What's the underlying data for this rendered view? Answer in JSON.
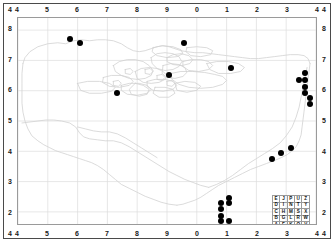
{
  "figure": {
    "kind": "distribution-map",
    "background": "#ffffff",
    "frame_color": "#4a4a4a",
    "plot_border_color": "#9a9a9a",
    "grid_color": "#dcdcdc",
    "coastline_color": "#d2d2d2",
    "marker_color": "#000000",
    "label_color": "#1a1a1a"
  },
  "axes": {
    "top_labels": [
      "4",
      "5",
      "6",
      "7",
      "8",
      "9",
      "0",
      "1",
      "2",
      "3",
      "4"
    ],
    "bottom_labels": [
      "4",
      "5",
      "6",
      "7",
      "8",
      "9",
      "0",
      "1",
      "2",
      "3",
      "4"
    ],
    "left_labels": [
      "4",
      "8",
      "7",
      "6",
      "5",
      "4",
      "3",
      "2",
      "4"
    ],
    "right_labels": [
      "4",
      "8",
      "7",
      "6",
      "5",
      "4",
      "3",
      "2",
      "4"
    ],
    "x_inner_labels": [
      "4",
      "5",
      "6",
      "7",
      "8",
      "9",
      "0",
      "1",
      "2",
      "3",
      "4"
    ],
    "y_inner_labels": [
      "8",
      "7",
      "6",
      "5",
      "4",
      "3",
      "2"
    ],
    "corner_label": "4"
  },
  "chart_data": {
    "type": "scatter",
    "title": "",
    "xlabel": "",
    "ylabel": "",
    "xlim": [
      4,
      14
    ],
    "ylim": [
      1.6,
      8.4
    ],
    "xtick_labels": [
      "4",
      "5",
      "6",
      "7",
      "8",
      "9",
      "0",
      "1",
      "2",
      "3",
      "4"
    ],
    "ytick_labels": [
      "8",
      "7",
      "6",
      "5",
      "4",
      "3",
      "2"
    ],
    "grid": true,
    "legend": "none",
    "series": [
      {
        "name": "records",
        "marker": "filled-circle",
        "color": "#000000",
        "points": [
          {
            "x": 5.72,
            "y": 7.72
          },
          {
            "x": 6.08,
            "y": 7.57
          },
          {
            "x": 9.52,
            "y": 7.57
          },
          {
            "x": 11.1,
            "y": 6.77
          },
          {
            "x": 9.02,
            "y": 6.55
          },
          {
            "x": 7.31,
            "y": 5.95
          },
          {
            "x": 13.55,
            "y": 6.6
          },
          {
            "x": 13.38,
            "y": 6.36
          },
          {
            "x": 13.56,
            "y": 6.36
          },
          {
            "x": 13.55,
            "y": 6.15
          },
          {
            "x": 13.55,
            "y": 5.95
          },
          {
            "x": 13.74,
            "y": 5.8
          },
          {
            "x": 13.74,
            "y": 5.6
          },
          {
            "x": 13.1,
            "y": 4.15
          },
          {
            "x": 12.78,
            "y": 3.98
          },
          {
            "x": 12.45,
            "y": 3.78
          },
          {
            "x": 11.02,
            "y": 2.52
          },
          {
            "x": 10.78,
            "y": 2.35
          },
          {
            "x": 11.02,
            "y": 2.35
          },
          {
            "x": 10.78,
            "y": 2.15
          },
          {
            "x": 10.78,
            "y": 1.92
          },
          {
            "x": 10.78,
            "y": 1.75
          },
          {
            "x": 11.02,
            "y": 1.75
          }
        ]
      }
    ]
  },
  "legend_grid": {
    "rows": [
      [
        "E",
        "J",
        "P",
        "U",
        "Z"
      ],
      [
        "D",
        "I",
        "N",
        "T",
        "Y"
      ],
      [
        "C",
        "H",
        "M",
        "S",
        "X"
      ],
      [
        "B",
        "G",
        "L",
        "R",
        "W"
      ],
      [
        "A",
        "F",
        "K",
        "Q",
        "V"
      ]
    ]
  }
}
